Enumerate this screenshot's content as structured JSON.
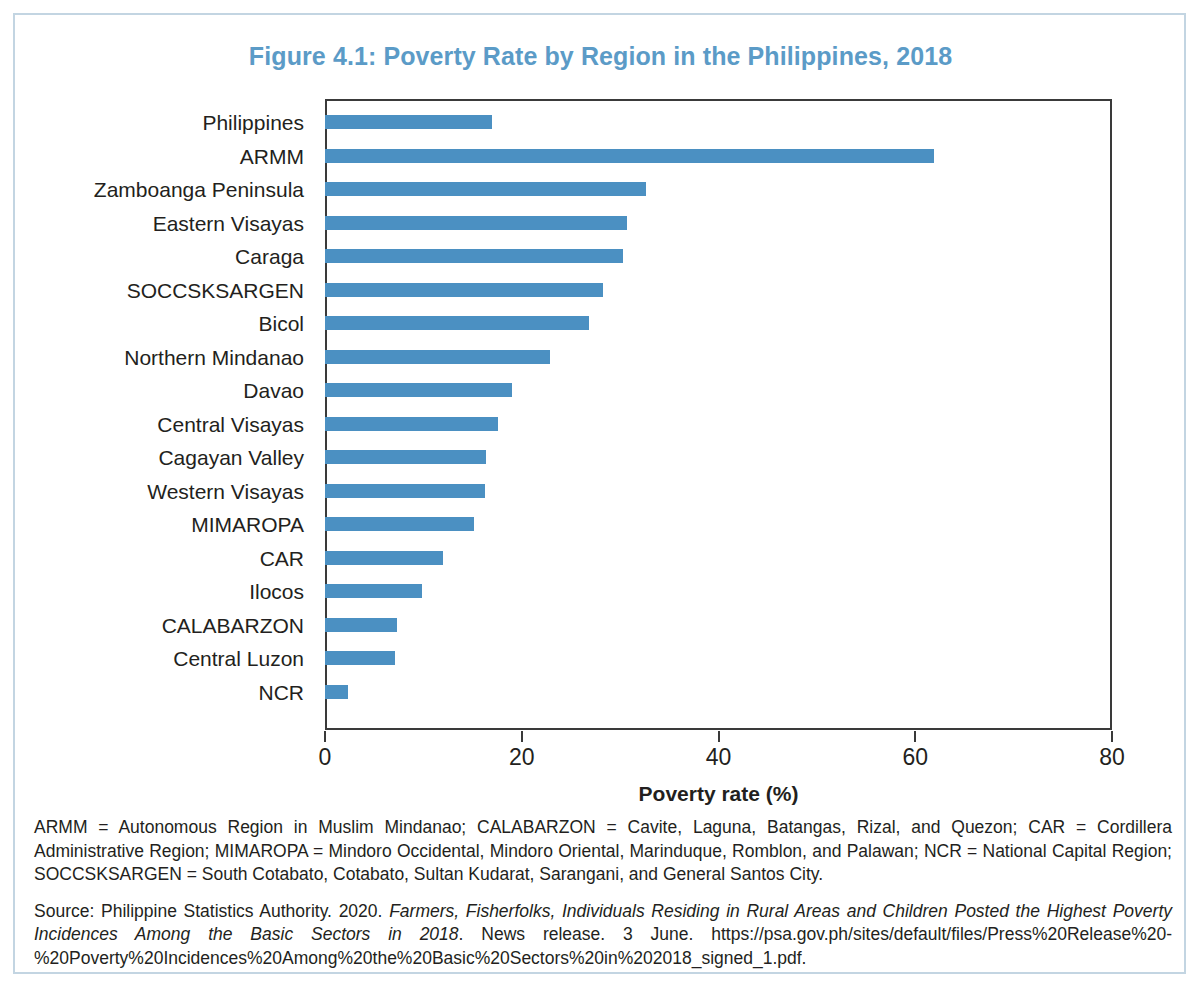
{
  "figure": {
    "title": "Figure 4.1: Poverty Rate by Region in the Philippines, 2018",
    "title_color": "#5b9bc7",
    "bar_color": "#4b90c2",
    "frame_color": "#c3d5e2"
  },
  "chart_data": {
    "type": "bar",
    "orientation": "horizontal",
    "title": "Figure 4.1: Poverty Rate by Region in the Philippines, 2018",
    "xlabel": "Poverty rate (%)",
    "ylabel": "",
    "xlim": [
      0,
      80
    ],
    "xticks": [
      "0",
      "20",
      "40",
      "60",
      "80"
    ],
    "xtick_values": [
      0,
      20,
      40,
      60,
      80
    ],
    "grid": false,
    "legend": false,
    "series_color": "#4b90c2",
    "categories": [
      "Philippines",
      "ARMM",
      "Zamboanga Peninsula",
      "Eastern Visayas",
      "Caraga",
      "SOCCSKSARGEN",
      "Bicol",
      "Northern Mindanao",
      "Davao",
      "Central Visayas",
      "Cagayan Valley",
      "Western Visayas",
      "MIMAROPA",
      "CAR",
      "Ilocos",
      "CALABARZON",
      "Central Luzon",
      "NCR"
    ],
    "values": [
      17.0,
      61.9,
      32.6,
      30.7,
      30.3,
      28.3,
      26.8,
      22.9,
      19.0,
      17.6,
      16.4,
      16.3,
      15.1,
      12.0,
      9.9,
      7.3,
      7.1,
      2.3
    ]
  },
  "notes": {
    "abbreviations": "ARMM = Autonomous Region in Muslim Mindanao; CALABARZON = Cavite, Laguna, Batangas, Rizal, and Quezon; CAR = Cordillera Administrative Region; MIMAROPA = Mindoro Occidental, Mindoro Oriental, Marinduque, Romblon, and Palawan; NCR = National Capital Region; SOCCSKSARGEN = South Cotabato, Cotabato, Sultan Kudarat, Sarangani, and General Santos City.",
    "source_prefix": "Source: Philippine Statistics Authority. 2020. ",
    "source_italic": "Farmers, Fisherfolks, Individuals Residing in Rural Areas and Children Posted the Highest Poverty Incidences Among the Basic Sectors in 2018",
    "source_suffix": ". News release. 3 June. https://psa.gov.ph/sites/default/files/Press%20Release%20-%20Poverty%20Incidences%20Among%20the%20Basic%20Sectors%20in%202018_signed_1.pdf."
  }
}
